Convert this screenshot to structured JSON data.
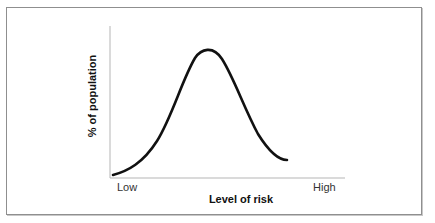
{
  "diagram": {
    "type": "bell-curve",
    "xlabel": "Level of risk",
    "ylabel": "% of population",
    "x_tick_labels": {
      "low": "Low",
      "high": "High"
    },
    "colors": {
      "curve": "#111111",
      "axis": "#b5b5b5",
      "frame": "#8f8f8f",
      "background": "#ffffff"
    },
    "curve_points": [
      [
        113,
        175
      ],
      [
        125,
        170
      ],
      [
        140,
        161
      ],
      [
        155,
        145
      ],
      [
        168,
        120
      ],
      [
        180,
        90
      ],
      [
        192,
        62
      ],
      [
        200,
        51
      ],
      [
        207,
        49
      ],
      [
        214,
        51
      ],
      [
        222,
        61
      ],
      [
        230,
        75
      ],
      [
        240,
        97
      ],
      [
        250,
        120
      ],
      [
        260,
        138
      ],
      [
        270,
        150
      ],
      [
        278,
        156
      ],
      [
        287,
        160
      ]
    ]
  }
}
